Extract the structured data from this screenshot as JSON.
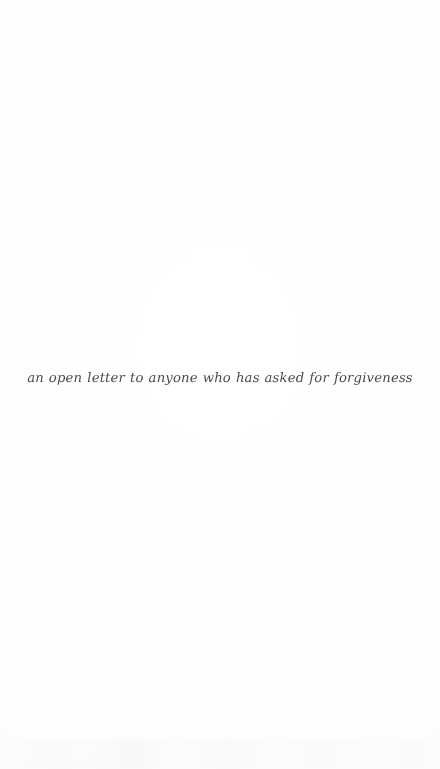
{
  "page": {
    "background_color": "#fefefe",
    "ink_color": "#3a3a3c"
  },
  "content": {
    "caption": "an open letter to anyone who has asked for forgiveness"
  }
}
